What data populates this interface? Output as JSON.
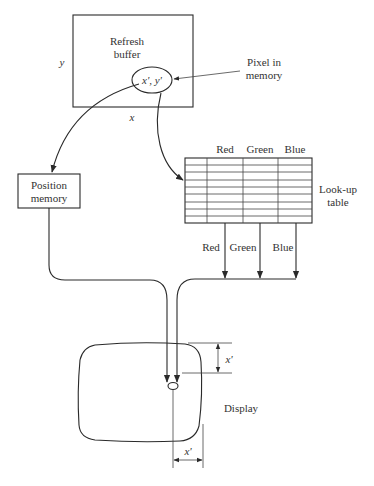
{
  "diagram": {
    "refresh_buffer": {
      "line1": "Refresh",
      "line2": "buffer",
      "axis_x": "x",
      "axis_y": "y"
    },
    "pixel": {
      "coords": "x', y'",
      "label_line1": "Pixel in",
      "label_line2": "memory"
    },
    "position_memory": {
      "line1": "Position",
      "line2": "memory"
    },
    "lookup_table": {
      "columns": [
        "Red",
        "Green",
        "Blue"
      ],
      "label_line1": "Look-up",
      "label_line2": "table",
      "rows": 9,
      "outputs": [
        "Red",
        "Green",
        "Blue"
      ]
    },
    "display": {
      "label": "Display",
      "offset_y": "x'",
      "offset_x": "x'"
    }
  }
}
